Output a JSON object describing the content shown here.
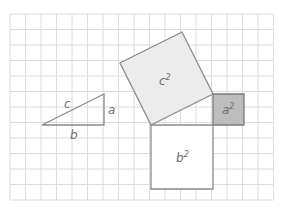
{
  "diagram": {
    "grid": {
      "x0": 10,
      "y0": 14,
      "cell": 15.5,
      "cols": 17,
      "rows": 12,
      "color": "#dcdcdc"
    },
    "colors": {
      "stroke": "#8a8a8a",
      "c_square_fill": "#ececec",
      "a_square_fill": "#bdbdbd",
      "b_square_fill": "#ffffff",
      "text": "#6e6e6e"
    },
    "triangle": {
      "points": "42,125 104,125 104,94",
      "labels": {
        "c": "c",
        "a": "a",
        "b": "b"
      }
    },
    "squares": {
      "c2": {
        "points": "151,125 213,94 182,32 120,63",
        "label": "c",
        "exp": "2"
      },
      "a2": {
        "points": "213,94 244,94 244,125 213,125",
        "label": "a",
        "exp": "2"
      },
      "b2": {
        "points": "151,125 213,125 213,189 151,189",
        "label": "b",
        "exp": "2"
      }
    }
  }
}
